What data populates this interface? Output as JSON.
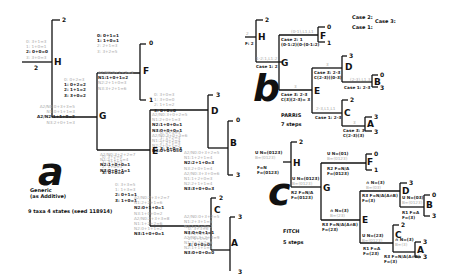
{
  "panel_a": {
    "label": "a",
    "caption": [
      "Generic",
      "(as Additive)"
    ],
    "info": "9 taxa 4 states (seed 118914)",
    "nodes": {
      "H": "H",
      "G": "G",
      "F": "F",
      "E": "E",
      "D": "D",
      "C": "C",
      "B": "B",
      "A": "A"
    },
    "leaves": {
      "H_top": "2",
      "root": "2",
      "F_top": "0",
      "F_bot": "1",
      "D_top": "3",
      "B_top": "0",
      "B_bot": "3",
      "C_top": "2",
      "A_top": "3",
      "A_bot": "3"
    },
    "H_states": [
      "0: 3+1=3",
      "1: 1+0=1",
      "2: 0+0=0",
      "3: 3+0=3"
    ],
    "G_states": [
      "0: 0+2=3",
      "1: 0+2=2",
      "2: 1+1=2",
      "3: 3+0=2"
    ],
    "G_rows": [
      "A2/N0:0+3+3=5",
      "N1:0+1+1=3",
      "A2/N2:1+1+0=2",
      "N3:2+0+1=3"
    ],
    "F_states": [
      "0: 0+1=1",
      "1: 1+0=1",
      "2: 2+1=3",
      "3: 3+2=5"
    ],
    "F_rows": [
      "A2/N0:0+1+2=3",
      "N1:1+0+1=2",
      "N2:2+1+0=3",
      "N3:3+2+1=6"
    ],
    "D_states": [
      "0: 3+0=3",
      "1: 3+0=0",
      "2: 1+1=2",
      "3: 0+0=0"
    ],
    "D_rows": [
      "A2/N0:3+0+2=5",
      "N1:2+0+1=3",
      "N2:1+0+0=1",
      "N3:0+0+0=1",
      "A2/N0:3+0+3=6",
      "N1:2+0+2=4",
      "N2:2+0+1=2",
      "N3:0+0+0=0"
    ],
    "E_pre": [
      "0: 3+2=5",
      "1: 3+1=3",
      "2: 1+0=1",
      "3: 0+0=0"
    ],
    "E_rows": [
      "A2/N0:3+2+2=7",
      "N1:2+1+1=4",
      "N2:1+0+0=1",
      "N3:0+0+1=1"
    ],
    "B_states": [
      "0: 0+3=3",
      "1: 1+2=3",
      "2: 2+1=3",
      "3: 3+0=3"
    ],
    "B_rows": [
      "A2/N0:0+3+2=5",
      "N1:1+2+1=4",
      "N2:2+1+0=3",
      "N3:2+0+1=4",
      "A2/N0:3+3+0=6",
      "N1:1+2+0=3",
      "N2:2+1+1=4",
      "N3:3+0+0=3"
    ],
    "C_states": [
      "0: 3+3=5",
      "1: 1+3=3",
      "2: 0+1=1",
      "3: 1+0=1"
    ],
    "C_rows": [
      "A2/N0:2+3+2=7",
      "N1:2+2+1=6",
      "N2:0+1+0=1",
      "N3:1+0+0=2",
      "A2/N0:2+3+3=8",
      "N1:1+2+2=6",
      "N2:0+1+1=2",
      "N3:1+0+0=1"
    ],
    "A_states": [
      "0: 3+3=6",
      "1: 2+2=4",
      "2: 1+1=2",
      "3: 0+0=0"
    ],
    "A_rows": [
      "A2/N0:0+3+2=5",
      "N1:2+3+1=5",
      "N2:1+1+0=2",
      "N3:0+0+1=1",
      "A2/N0:3+3+3=9",
      "N1:2+2+2=6",
      "N2:1+1+1=3",
      "N3:0+0+0=0"
    ]
  },
  "panel_b": {
    "label": "b",
    "method": "PARRIS",
    "steps": "7 steps",
    "legend": [
      "Case 2:",
      "Case 3:",
      "Case 1:"
    ],
    "root_label": "F: 2",
    "root_val": "2",
    "nodes": {
      "H": "H",
      "G": "G",
      "F": "F",
      "E": "E",
      "D": "D",
      "C": "C",
      "B": "B",
      "A": "A"
    },
    "leaves": {
      "H_top": "2",
      "F_top": "0",
      "F_bot": "1",
      "D_top": "3",
      "B_top": "0",
      "B_bot": "3",
      "C_top": "2",
      "A_top": "3",
      "A_bot": "3"
    },
    "annotations": {
      "G_branch": "1-2:1,L1:2",
      "G_case": "Case 1: 2",
      "F_branch": "(0-1),L1,L1",
      "F_case": [
        "Case 2: 1",
        "(0-1:2)(0-(0-1:2)"
      ],
      "E_branch": "3",
      "E_case": [
        "Case 3: 2-3",
        "C(3)(2-3)= 3"
      ],
      "D_branch": "3",
      "D_case": [
        "Case 3: 2-3",
        "C(2-3)((0-3)"
      ],
      "B_branch": "(2-3),L1,3",
      "B_case": "Case 1: 2-3",
      "C_branch": "2-3,L1,L1",
      "C_case": "Case 1: 2-3",
      "A_branch": "3",
      "A_case": [
        "Case 3: 3",
        "C(2-3)(3)"
      ]
    }
  },
  "panel_c": {
    "label": "c",
    "method": "FITCH",
    "steps": "5 steps",
    "root_labels": [
      "F=N",
      "F=(0123)"
    ],
    "nodes": {
      "H": "H",
      "G": "G",
      "F": "F",
      "E": "E",
      "D": "D",
      "C": "C",
      "B": "B",
      "A": "A"
    },
    "leaves": {
      "H_top": "2",
      "F_top": "0",
      "F_bot": "1",
      "D_top": "3",
      "B_top": "0",
      "B_bot": "3",
      "C_top": "2",
      "A_top": "3",
      "A_bot": "3"
    },
    "annotations": {
      "H_U": [
        "U  N=(0123)",
        "B=(0123)"
      ],
      "G_U": [
        "U  N=(0123)",
        "B=(0123)"
      ],
      "G_R": [
        "R2 F=N/A",
        "F=(0123)"
      ],
      "F_U": [
        "U  N=(01)",
        "B=(0123)"
      ],
      "F_R": [
        "R2 F=N/A",
        "F=(0123)"
      ],
      "E_I": [
        "∩  N=(3)",
        "B=(23)"
      ],
      "E_R": [
        "R3 F=N/A(A∩B)",
        "F=(23)"
      ],
      "D_I": [
        "∩  N=(3)",
        "B=(03)"
      ],
      "D_R": [
        "R3 F=N/A(A∩B)",
        "F=(3)"
      ],
      "B_U": [
        "U  N=(03)",
        "B=(0123)"
      ],
      "B_R": [
        "R1 F=A",
        "F=(3)"
      ],
      "C_U": [
        "U  N=(23)",
        "B=(0123)"
      ],
      "C_R": [
        "R1 F=A",
        "F=(23)"
      ],
      "A_I": [
        "∩  N=(3)",
        "B=(3)"
      ],
      "A_R": [
        "R3 F=N/A(A∩B)",
        "F=(3)"
      ]
    }
  }
}
